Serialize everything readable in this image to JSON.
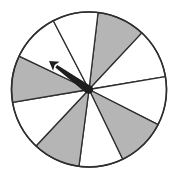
{
  "spinner": {
    "center": [
      89,
      89.5
    ],
    "radius": 77.5,
    "colors": {
      "shaded": "#b5b5b5",
      "unshaded": "#ffffff",
      "outline": "#2e2e2e",
      "arrow": "#1e1e1e"
    },
    "boundary_points": [
      [
        98,
        13
      ],
      [
        139,
        36
      ],
      [
        163,
        77
      ],
      [
        155,
        123
      ],
      [
        122,
        158
      ],
      [
        79,
        166
      ],
      [
        37,
        145
      ],
      [
        15,
        102
      ],
      [
        21,
        57
      ],
      [
        54,
        22
      ]
    ],
    "sectors": [
      {
        "from": 0,
        "to": 1,
        "shaded": true
      },
      {
        "from": 1,
        "to": 2,
        "shaded": false
      },
      {
        "from": 2,
        "to": 3,
        "shaded": false
      },
      {
        "from": 3,
        "to": 4,
        "shaded": true
      },
      {
        "from": 4,
        "to": 5,
        "shaded": false
      },
      {
        "from": 5,
        "to": 6,
        "shaded": true
      },
      {
        "from": 6,
        "to": 7,
        "shaded": false
      },
      {
        "from": 7,
        "to": 8,
        "shaded": true
      },
      {
        "from": 8,
        "to": 9,
        "shaded": false
      },
      {
        "from": 9,
        "to": 0,
        "shaded": false
      }
    ],
    "arrow": {
      "tail": [
        89,
        90
      ],
      "tip": [
        49,
        61
      ]
    }
  }
}
